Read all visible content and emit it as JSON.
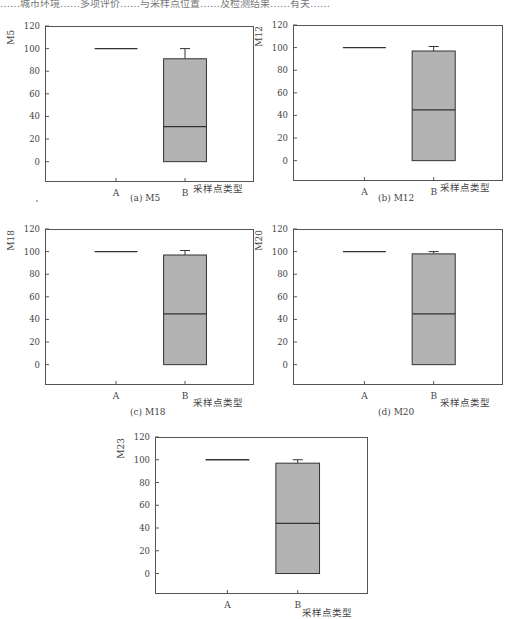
{
  "header_fragment": "……城市环境……多项评价……与采样点位置……及检测结果……有关……",
  "chart_data": [
    {
      "type": "box",
      "panel_label": "(a) M5",
      "ylabel": "M5",
      "xlabel": "采样点类型",
      "categories": [
        "A",
        "B"
      ],
      "yticks": [
        0,
        20,
        40,
        60,
        80,
        100,
        120
      ],
      "ylim": [
        -18,
        120
      ],
      "grid": false,
      "series": [
        {
          "name": "A",
          "min": 100,
          "q1": 100,
          "median": 100,
          "q3": 100,
          "max": 100
        },
        {
          "name": "B",
          "min": 0,
          "q1": 0,
          "median": 31,
          "q3": 91,
          "max": 100
        }
      ]
    },
    {
      "type": "box",
      "panel_label": "(b) M12",
      "ylabel": "M12",
      "xlabel": "采样点类型",
      "categories": [
        "A",
        "B"
      ],
      "yticks": [
        0,
        20,
        40,
        60,
        80,
        100,
        120
      ],
      "ylim": [
        -18,
        120
      ],
      "grid": false,
      "series": [
        {
          "name": "A",
          "min": 100,
          "q1": 100,
          "median": 100,
          "q3": 100,
          "max": 100
        },
        {
          "name": "B",
          "min": 0,
          "q1": 0,
          "median": 45,
          "q3": 97,
          "max": 101
        }
      ]
    },
    {
      "type": "box",
      "panel_label": "(c) M18",
      "ylabel": "M18",
      "xlabel": "采样点类型",
      "categories": [
        "A",
        "B"
      ],
      "yticks": [
        0,
        20,
        40,
        60,
        80,
        100,
        120
      ],
      "ylim": [
        -18,
        120
      ],
      "grid": false,
      "series": [
        {
          "name": "A",
          "min": 100,
          "q1": 100,
          "median": 100,
          "q3": 100,
          "max": 100
        },
        {
          "name": "B",
          "min": 0,
          "q1": 0,
          "median": 45,
          "q3": 97,
          "max": 101
        }
      ]
    },
    {
      "type": "box",
      "panel_label": "(d) M20",
      "ylabel": "M20",
      "xlabel": "采样点类型",
      "categories": [
        "A",
        "B"
      ],
      "yticks": [
        0,
        20,
        40,
        60,
        80,
        100,
        120
      ],
      "ylim": [
        -18,
        120
      ],
      "grid": false,
      "series": [
        {
          "name": "A",
          "min": 100,
          "q1": 100,
          "median": 100,
          "q3": 100,
          "max": 100
        },
        {
          "name": "B",
          "min": 0,
          "q1": 0,
          "median": 45,
          "q3": 98,
          "max": 100
        }
      ]
    },
    {
      "type": "box",
      "panel_label": "",
      "ylabel": "M23",
      "xlabel": "采样点类型",
      "categories": [
        "A",
        "B"
      ],
      "yticks": [
        0,
        20,
        40,
        60,
        80,
        100,
        120
      ],
      "ylim": [
        -18,
        120
      ],
      "grid": false,
      "series": [
        {
          "name": "A",
          "min": 100,
          "q1": 100,
          "median": 100,
          "q3": 100,
          "max": 100
        },
        {
          "name": "B",
          "min": 0,
          "q1": 0,
          "median": 44,
          "q3": 97,
          "max": 100
        }
      ]
    }
  ],
  "colors": {
    "box_fill": "#b3b3b3",
    "line": "#333333",
    "axis": "#555555",
    "text": "#444444"
  }
}
